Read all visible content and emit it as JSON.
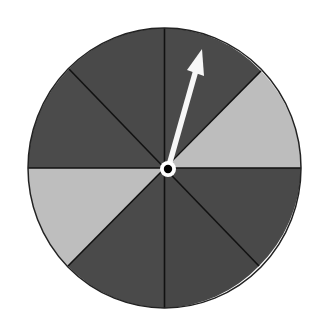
{
  "diagram": {
    "type": "spinner",
    "description": "Eight-sector spinner with an arrow pointer",
    "sector_count": 8,
    "colors": {
      "dark": "#4a4a4a",
      "light": "#bdbdbd",
      "divider": "#111111",
      "outline": "#222222",
      "arrow": "#f7f7f7",
      "hub_ring": "#ffffff",
      "hub_center": "#000000",
      "background": "#ffffff"
    },
    "sectors": [
      {
        "index": 0,
        "position": "top-right (12 to 1:30)",
        "shade": "dark"
      },
      {
        "index": 1,
        "position": "right-upper (1:30 to 3)",
        "shade": "light"
      },
      {
        "index": 2,
        "position": "right-lower (3 to 4:30)",
        "shade": "dark"
      },
      {
        "index": 3,
        "position": "bottom-right (4:30 to 6)",
        "shade": "dark"
      },
      {
        "index": 4,
        "position": "bottom-left (6 to 7:30)",
        "shade": "dark"
      },
      {
        "index": 5,
        "position": "left-lower (7:30 to 9)",
        "shade": "light"
      },
      {
        "index": 6,
        "position": "left-upper (9 to 10:30)",
        "shade": "dark"
      },
      {
        "index": 7,
        "position": "top-left (10:30 to 12)",
        "shade": "dark"
      }
    ],
    "light_sector_count": 2,
    "dark_sector_count": 6,
    "pointer": {
      "points_to_sector": 0,
      "shade_pointed": "dark"
    }
  }
}
